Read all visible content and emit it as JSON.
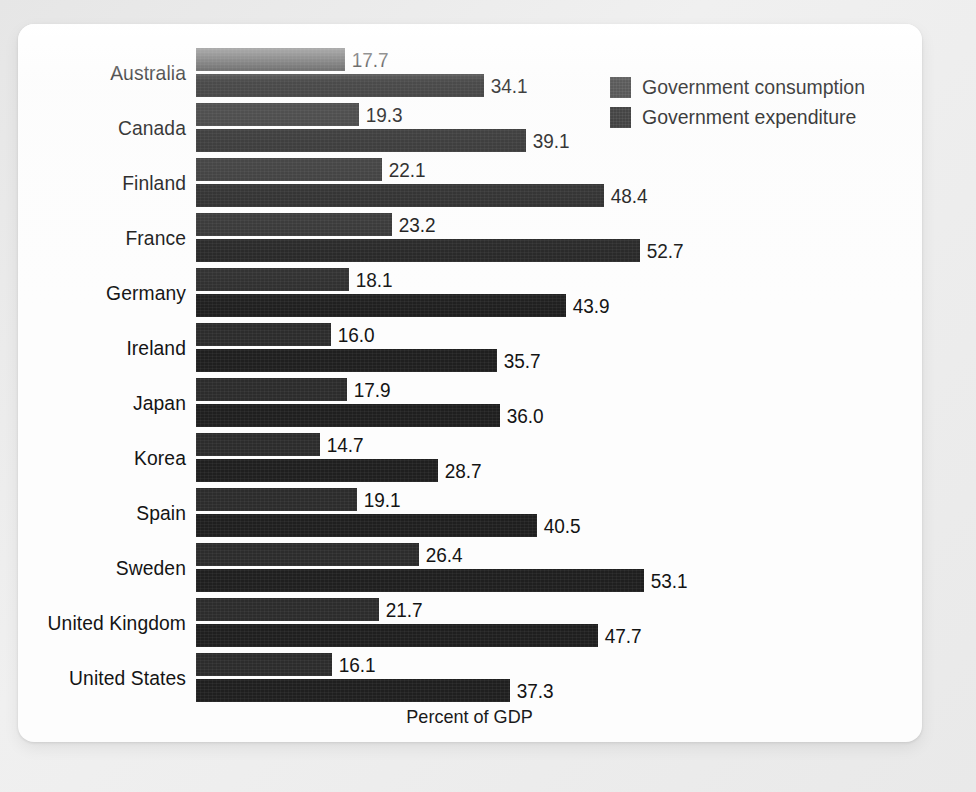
{
  "chart_data": {
    "type": "bar",
    "orientation": "horizontal",
    "title": "",
    "xlabel": "Percent of GDP",
    "ylabel": "",
    "xlim": [
      0,
      55
    ],
    "grid": false,
    "legend_position": "top-right",
    "categories": [
      "Australia",
      "Canada",
      "Finland",
      "France",
      "Germany",
      "Ireland",
      "Japan",
      "Korea",
      "Spain",
      "Sweden",
      "United Kingdom",
      "United States"
    ],
    "series": [
      {
        "name": "Government consumption",
        "color": "#2c2c2c",
        "values": [
          17.7,
          19.3,
          22.1,
          23.2,
          18.1,
          16.0,
          17.9,
          14.7,
          19.1,
          26.4,
          21.7,
          16.1
        ],
        "labels": [
          "17.7",
          "19.3",
          "22.1",
          "23.2",
          "18.1",
          "16.0",
          "17.9",
          "14.7",
          "19.1",
          "26.4",
          "21.7",
          "16.1"
        ]
      },
      {
        "name": "Government expenditure",
        "color": "#1f1f1f",
        "values": [
          34.1,
          39.1,
          48.4,
          52.7,
          43.9,
          35.7,
          36.0,
          28.7,
          40.5,
          53.1,
          47.7,
          37.3
        ],
        "labels": [
          "34.1",
          "39.1",
          "48.4",
          "52.7",
          "43.9",
          "35.7",
          "36.0",
          "28.7",
          "40.5",
          "53.1",
          "47.7",
          "37.3"
        ]
      }
    ]
  },
  "legend": {
    "items": [
      {
        "label": "Government consumption",
        "swatch": "consumption"
      },
      {
        "label": "Government expenditure",
        "swatch": "expenditure"
      }
    ]
  },
  "axis": {
    "x_title": "Percent of GDP"
  },
  "style": {
    "bar_color_consumption": "#2c2c2c",
    "bar_color_expenditure": "#1f1f1f",
    "text_color": "#141414",
    "card_background": "#fdfdfd",
    "page_background": "#ebebeb"
  }
}
